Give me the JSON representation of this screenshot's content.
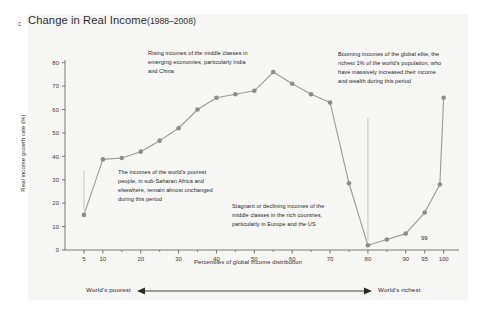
{
  "figure": {
    "panel_letter": "c",
    "title_main": "Change in Real Income",
    "title_years": "(1988–2008)"
  },
  "colors": {
    "panel_background": "#f6f6f4",
    "line": "#9a9a9a",
    "marker": "#8c8c8c",
    "axis": "#5a5a5a",
    "text": "#262626",
    "leader_line": "#b0b0b0"
  },
  "annotations": {
    "rising_middle": "Rising incomes of the middle classes in emerging economies, particularly India and China",
    "poorest_unchanged": "The incomes of the world's poorest people, in sub-Saharan Africa and elsewhere, remain almost unchanged during this period",
    "stagnant_rich_middle": "Stagnant or declining incomes of the middle classes in the rich countries, particularly in Europe and the US",
    "booming_elite": "Booming incomes of the global elite, the richest 1% of the world's population, who have massively increased their income and wealth during this period"
  },
  "point_labels": {
    "p99": "99"
  },
  "footer": {
    "left": "World's poorest",
    "right": "World's richest"
  },
  "chart_data": {
    "type": "line",
    "xlabel": "Percentiles of global income distribution",
    "ylabel": "Real income growth rate (%)",
    "xlim": [
      0,
      103
    ],
    "ylim": [
      0,
      82
    ],
    "grid": false,
    "legend": "none",
    "x_ticks": [
      5,
      10,
      20,
      30,
      40,
      50,
      60,
      70,
      80,
      90,
      95,
      100
    ],
    "x_tick_labels": [
      "5",
      "10",
      "20",
      "30",
      "40",
      "50",
      "60",
      "70",
      "80",
      "90",
      "95",
      "100"
    ],
    "x_minor_ticks": [
      15,
      25,
      35,
      45,
      55,
      65,
      75,
      85
    ],
    "y_ticks": [
      0,
      10,
      20,
      30,
      40,
      50,
      60,
      70,
      80
    ],
    "y_tick_labels": [
      "0",
      "10",
      "20",
      "30",
      "40",
      "50",
      "60",
      "70",
      "80"
    ],
    "series": [
      {
        "name": "Real income growth rate",
        "x": [
          5,
          10,
          15,
          20,
          25,
          30,
          35,
          40,
          45,
          50,
          55,
          60,
          65,
          70,
          75,
          80,
          85,
          90,
          95,
          99,
          100
        ],
        "values": [
          15,
          38.7,
          39.3,
          42,
          46.7,
          52,
          60,
          65,
          66.5,
          68,
          76,
          71,
          66.5,
          63,
          28.5,
          2,
          4.5,
          7,
          16,
          28,
          65
        ]
      }
    ]
  }
}
